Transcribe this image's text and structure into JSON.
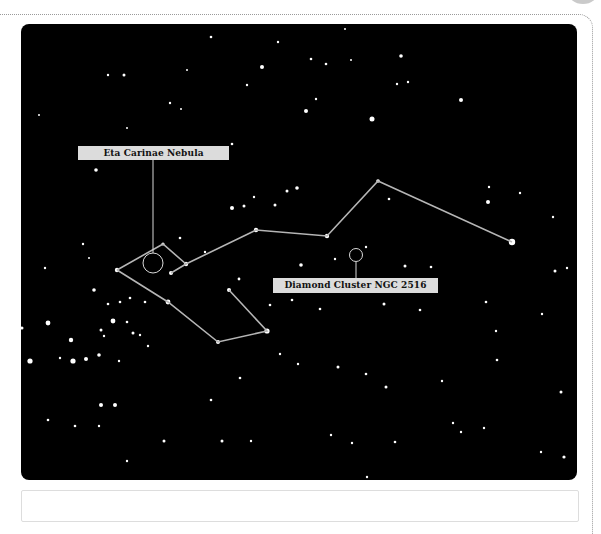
{
  "image": {
    "subject": "Star field with constellation lines (Carina region)",
    "background_color": "#000000",
    "line_color": "#b5b5b5"
  },
  "labels": [
    {
      "id": "eta-carinae",
      "text": "Eta Carinae Nebula"
    },
    {
      "id": "diamond-cluster",
      "text": "Diamond Cluster NGC 2516"
    }
  ],
  "constellation": {
    "polylines": [
      [
        [
          117,
          270
        ],
        [
          163,
          244
        ],
        [
          186,
          264
        ]
      ],
      [
        [
          171,
          273
        ],
        [
          186,
          264
        ],
        [
          256,
          230
        ],
        [
          327,
          236
        ],
        [
          378,
          181
        ],
        [
          512,
          242
        ]
      ],
      [
        [
          117,
          270
        ],
        [
          168,
          302
        ],
        [
          218,
          342
        ],
        [
          267,
          331
        ],
        [
          229,
          290
        ]
      ]
    ]
  }
}
